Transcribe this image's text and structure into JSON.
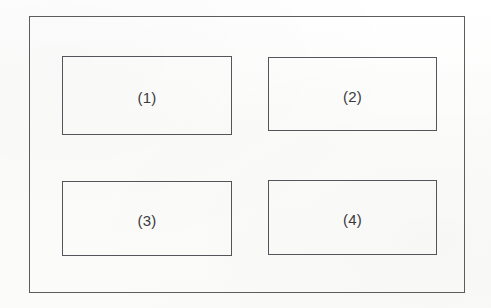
{
  "diagram": {
    "type": "block-diagram",
    "background_color": "#fdfdfd",
    "line_color": "#54545a",
    "text_color": "#3a3a3c",
    "outer_frame": {
      "name": "outer-enclosure",
      "x": 29,
      "y": 16,
      "width": 436,
      "height": 277
    },
    "blocks": [
      {
        "label": "(1)",
        "x": 62,
        "y": 56,
        "width": 170,
        "height": 79,
        "row": 1,
        "column": 1
      },
      {
        "label": "(2)",
        "x": 268,
        "y": 57,
        "width": 169,
        "height": 74,
        "row": 1,
        "column": 2
      },
      {
        "label": "(3)",
        "x": 62,
        "y": 181,
        "width": 170,
        "height": 75,
        "row": 2,
        "column": 1
      },
      {
        "label": "(4)",
        "x": 268,
        "y": 180,
        "width": 169,
        "height": 75,
        "row": 2,
        "column": 2
      }
    ]
  }
}
